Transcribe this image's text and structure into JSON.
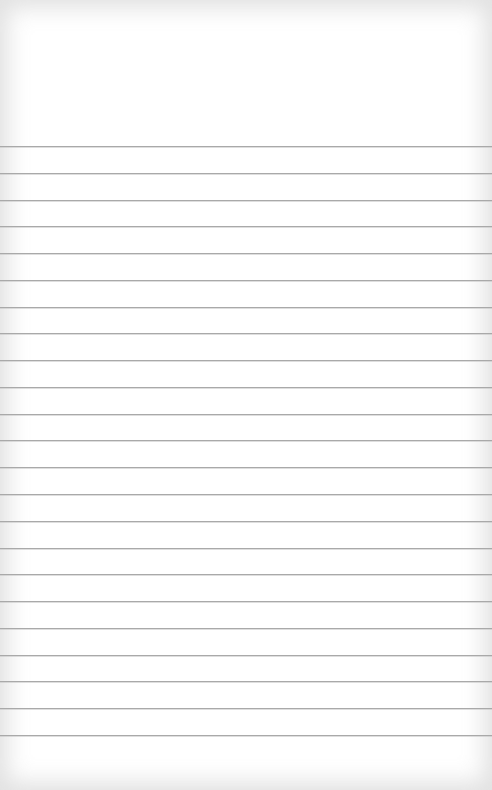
{
  "page": {
    "type": "lined-notepad-paper",
    "background_color": "#ffffff",
    "line_color": "#a9a9a9",
    "first_line_y": 146,
    "line_spacing": 26.77,
    "line_count": 23
  }
}
